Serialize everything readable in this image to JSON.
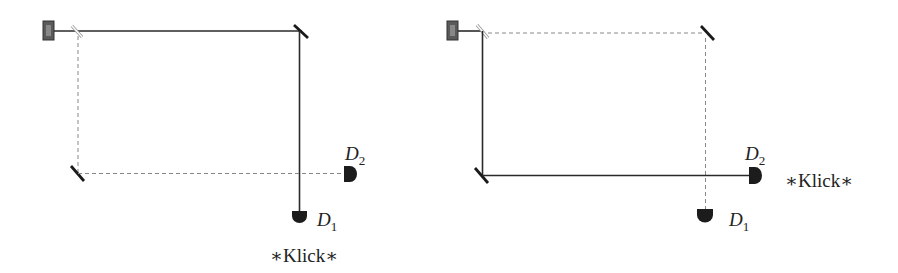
{
  "colors": {
    "beam": "#2a2a2a",
    "dashed": "#888888",
    "detector": "#1c1c1c",
    "laser": "#555555",
    "splitter": "#aaaaaa"
  },
  "left_setup": {
    "detector1": {
      "label": "D",
      "subscript": "1",
      "clicks": true
    },
    "detector2": {
      "label": "D",
      "subscript": "2",
      "clicks": false
    },
    "click_text": "∗Klick∗"
  },
  "right_setup": {
    "detector1": {
      "label": "D",
      "subscript": "1",
      "clicks": false
    },
    "detector2": {
      "label": "D",
      "subscript": "2",
      "clicks": true
    },
    "click_text": "∗Klick∗"
  }
}
